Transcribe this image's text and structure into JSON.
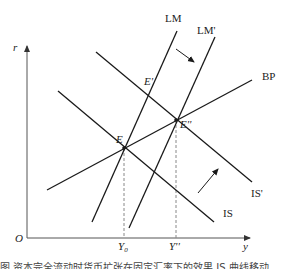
{
  "diagram": {
    "axes": {
      "y_axis_label": "r",
      "x_axis_label": "y",
      "origin_label": "O",
      "x_ticks": [
        {
          "label": "Y",
          "subscript": "0",
          "x": 124
        },
        {
          "label": "Y''",
          "subscript": "",
          "x": 176
        }
      ]
    },
    "curves": {
      "LM": {
        "label": "LM"
      },
      "LM_prime": {
        "label": "LM'"
      },
      "BP": {
        "label": "BP"
      },
      "IS": {
        "label": "IS"
      },
      "IS_prime": {
        "label": "IS'"
      }
    },
    "points": {
      "E": {
        "label": "E"
      },
      "E_prime": {
        "label": "E'"
      },
      "E_double_prime": {
        "label": "E''"
      }
    },
    "arrows": [
      {
        "name": "LM-shift-arrow",
        "direction": "down-right"
      },
      {
        "name": "IS-shift-arrow",
        "direction": "up-right"
      }
    ],
    "colors": {
      "line": "#1a1a1a",
      "axis": "#555555",
      "guide": "#888888"
    }
  },
  "caption": {
    "text": "图 资本完全流动时货币扩张在固定汇率下的效果 IS 曲线移动"
  }
}
